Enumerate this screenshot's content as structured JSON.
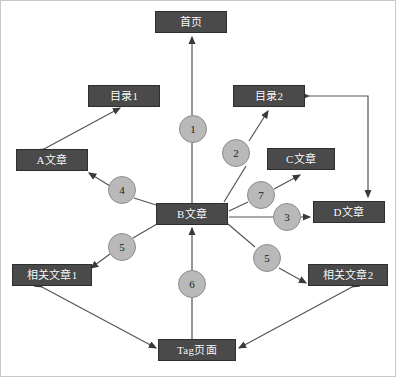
{
  "diagram": {
    "colors": {
      "node_fill": "#4a4a4a",
      "node_border": "#2e2e2e",
      "node_text": "#ffffff",
      "badge_fill": "#b9b9b9",
      "badge_border": "#8d8d8d",
      "badge_text": "#1a1a1a",
      "edge_stroke": "#555555",
      "canvas_background": "#ffffff"
    },
    "nodes": [
      {
        "id": "home",
        "label": "首页",
        "x": 155,
        "y": 11,
        "w": 72,
        "h": 22
      },
      {
        "id": "catalog1",
        "label": "目录1",
        "x": 88,
        "y": 85,
        "w": 72,
        "h": 22
      },
      {
        "id": "catalog2",
        "label": "目录2",
        "x": 233,
        "y": 85,
        "w": 72,
        "h": 22
      },
      {
        "id": "article-a",
        "label": "A文章",
        "x": 16,
        "y": 149,
        "w": 72,
        "h": 22
      },
      {
        "id": "article-c",
        "label": "C文章",
        "x": 267,
        "y": 148,
        "w": 68,
        "h": 22
      },
      {
        "id": "article-b",
        "label": "B文章",
        "x": 156,
        "y": 203,
        "w": 72,
        "h": 22
      },
      {
        "id": "article-d",
        "label": "D文章",
        "x": 313,
        "y": 201,
        "w": 72,
        "h": 22
      },
      {
        "id": "related1",
        "label": "相关文章1",
        "x": 12,
        "y": 264,
        "w": 80,
        "h": 22
      },
      {
        "id": "related2",
        "label": "相关文章2",
        "x": 308,
        "y": 264,
        "w": 80,
        "h": 22
      },
      {
        "id": "tag-page",
        "label": "Tag页面",
        "x": 158,
        "y": 339,
        "w": 78,
        "h": 22
      }
    ],
    "edge_labels": [
      {
        "id": "badge-1",
        "label": "1",
        "x": 193,
        "y": 129,
        "edge": "B文章 → 首页"
      },
      {
        "id": "badge-2",
        "label": "2",
        "x": 236,
        "y": 153,
        "edge": "B文章 → 目录2"
      },
      {
        "id": "badge-7",
        "label": "7",
        "x": 261,
        "y": 195,
        "edge": "B文章 → C文章"
      },
      {
        "id": "badge-3",
        "label": "3",
        "x": 287,
        "y": 217,
        "edge": "B文章 → D文章"
      },
      {
        "id": "badge-4",
        "label": "4",
        "x": 122,
        "y": 190,
        "edge": "B文章 → A文章"
      },
      {
        "id": "badge-5-left",
        "label": "5",
        "x": 122,
        "y": 247,
        "edge": "B文章 → 相关文章1"
      },
      {
        "id": "badge-5-right",
        "label": "5",
        "x": 267,
        "y": 258,
        "edge": "B文章 → 相关文章2"
      },
      {
        "id": "badge-6",
        "label": "6",
        "x": 192,
        "y": 284,
        "edge": "Tag页面 → B文章"
      }
    ],
    "edges": [
      {
        "id": "edge-b-home",
        "from": "article-b",
        "to": "home",
        "label": "1"
      },
      {
        "id": "edge-b-catalog2",
        "from": "article-b",
        "to": "catalog2",
        "label": "2"
      },
      {
        "id": "edge-b-articled",
        "from": "article-b",
        "to": "article-d",
        "label": "3"
      },
      {
        "id": "edge-b-articlea",
        "from": "article-b",
        "to": "article-a",
        "label": "4"
      },
      {
        "id": "edge-b-related1",
        "from": "article-b",
        "to": "related1",
        "label": "5"
      },
      {
        "id": "edge-b-related2",
        "from": "article-b",
        "to": "related2",
        "label": "5"
      },
      {
        "id": "edge-tag-b",
        "from": "tag-page",
        "to": "article-b",
        "label": "6"
      },
      {
        "id": "edge-b-articlec",
        "from": "article-b",
        "to": "article-c",
        "label": "7"
      },
      {
        "id": "edge-catalog1-articlea",
        "from": "catalog1",
        "to": "article-a",
        "label": ""
      },
      {
        "id": "edge-articlea-catalog1",
        "from": "article-a",
        "to": "catalog1",
        "label": ""
      },
      {
        "id": "edge-related1-tag",
        "from": "related1",
        "to": "tag-page",
        "label": ""
      },
      {
        "id": "edge-related2-tag",
        "from": "related2",
        "to": "tag-page",
        "label": ""
      },
      {
        "id": "edge-articled-catalog2",
        "from": "article-d",
        "to": "catalog2",
        "label": ""
      }
    ]
  }
}
